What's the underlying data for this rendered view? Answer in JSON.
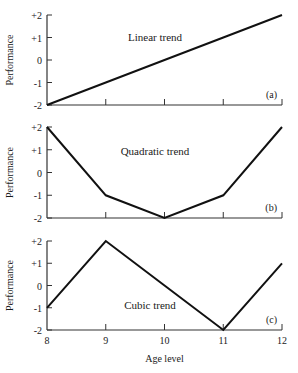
{
  "figure": {
    "shared_x": {
      "label": "Age level",
      "ticks": [
        "8",
        "9",
        "10",
        "11",
        "12"
      ]
    },
    "colors": {
      "line": "#111111",
      "axis": "#333333",
      "text": "#1a1a1a"
    }
  },
  "chart_data": [
    {
      "type": "line",
      "panel": "(a)",
      "title": "Linear trend",
      "xlabel": "",
      "ylabel": "Performance",
      "x": [
        8,
        9,
        10,
        11,
        12
      ],
      "values": [
        -2,
        -1,
        0,
        1,
        2
      ],
      "ylim": [
        -2,
        2
      ],
      "xlim": [
        8,
        12
      ],
      "yticks": [
        "+2",
        "+1",
        "0",
        "-1",
        "-2"
      ],
      "grid": false
    },
    {
      "type": "line",
      "panel": "(b)",
      "title": "Quadratic trend",
      "xlabel": "",
      "ylabel": "Performance",
      "x": [
        8,
        9,
        10,
        11,
        12
      ],
      "values": [
        2,
        -1,
        -2,
        -1,
        2
      ],
      "ylim": [
        -2,
        2
      ],
      "xlim": [
        8,
        12
      ],
      "yticks": [
        "+2",
        "+1",
        "0",
        "-1",
        "-2"
      ],
      "grid": false
    },
    {
      "type": "line",
      "panel": "(c)",
      "title": "Cubic trend",
      "xlabel": "Age level",
      "ylabel": "Performance",
      "x": [
        8,
        9,
        10,
        11,
        12
      ],
      "values": [
        -1,
        2,
        0,
        -2,
        1
      ],
      "ylim": [
        -2,
        2
      ],
      "xlim": [
        8,
        12
      ],
      "xticks": [
        "8",
        "9",
        "10",
        "11",
        "12"
      ],
      "yticks": [
        "+2",
        "+1",
        "0",
        "-1",
        "-2"
      ],
      "grid": false
    }
  ]
}
